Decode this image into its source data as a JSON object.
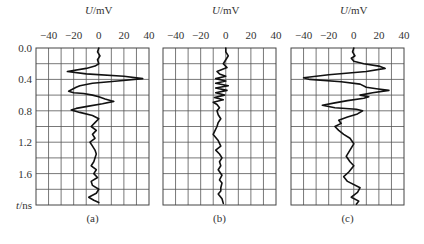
{
  "chart_data": [
    {
      "type": "line",
      "panel": "(a)",
      "title": "U/mV",
      "xlabel": "U/mV",
      "ylabel": "t/ns",
      "xlim": [
        -50,
        40
      ],
      "ylim": [
        0.0,
        2.0
      ],
      "x_ticks": [
        "-40",
        "-20",
        "0",
        "20",
        "40"
      ],
      "y_ticks": [
        "0.0",
        "0.4",
        "0.8",
        "1.2",
        "1.6"
      ],
      "grid": true,
      "series": [
        {
          "name": "trace-a",
          "points": [
            [
              0,
              0.0
            ],
            [
              -1,
              0.05
            ],
            [
              1,
              0.1
            ],
            [
              -1,
              0.15
            ],
            [
              0,
              0.2
            ],
            [
              -3,
              0.23
            ],
            [
              -10,
              0.26
            ],
            [
              -25,
              0.3
            ],
            [
              -10,
              0.33
            ],
            [
              20,
              0.36
            ],
            [
              35,
              0.39
            ],
            [
              15,
              0.42
            ],
            [
              -5,
              0.45
            ],
            [
              -15,
              0.48
            ],
            [
              -18,
              0.5
            ],
            [
              -24,
              0.55
            ],
            [
              -20,
              0.57
            ],
            [
              -12,
              0.58
            ],
            [
              -5,
              0.6
            ],
            [
              0,
              0.62
            ],
            [
              5,
              0.65
            ],
            [
              12,
              0.68
            ],
            [
              3,
              0.71
            ],
            [
              -8,
              0.74
            ],
            [
              -18,
              0.77
            ],
            [
              -22,
              0.79
            ],
            [
              -15,
              0.82
            ],
            [
              -5,
              0.86
            ],
            [
              0,
              0.9
            ],
            [
              -3,
              0.95
            ],
            [
              -6,
              1.0
            ],
            [
              -2,
              1.05
            ],
            [
              -5,
              1.1
            ],
            [
              -3,
              1.15
            ],
            [
              -7,
              1.2
            ],
            [
              -5,
              1.25
            ],
            [
              -3,
              1.3
            ],
            [
              -2,
              1.35
            ],
            [
              -3,
              1.4
            ],
            [
              -4,
              1.45
            ],
            [
              -6,
              1.5
            ],
            [
              -2,
              1.55
            ],
            [
              -4,
              1.6
            ],
            [
              -1,
              1.65
            ],
            [
              -6,
              1.7
            ],
            [
              -5,
              1.75
            ],
            [
              0,
              1.8
            ],
            [
              -2,
              1.85
            ],
            [
              -8,
              1.9
            ],
            [
              -4,
              1.94
            ],
            [
              0,
              1.97
            ]
          ]
        }
      ]
    },
    {
      "type": "line",
      "panel": "(b)",
      "title": "U/mV",
      "xlabel": "U/mV",
      "xlim": [
        -50,
        40
      ],
      "ylim": [
        0.0,
        2.0
      ],
      "x_ticks": [
        "-40",
        "-20",
        "0",
        "20",
        "40"
      ],
      "grid": true,
      "series": [
        {
          "name": "trace-b",
          "points": [
            [
              0,
              0.0
            ],
            [
              0,
              0.05
            ],
            [
              2,
              0.1
            ],
            [
              0,
              0.15
            ],
            [
              -2,
              0.2
            ],
            [
              1,
              0.25
            ],
            [
              -7,
              0.3
            ],
            [
              -5,
              0.33
            ],
            [
              0,
              0.36
            ],
            [
              -8,
              0.39
            ],
            [
              0,
              0.42
            ],
            [
              -8,
              0.45
            ],
            [
              2,
              0.48
            ],
            [
              -8,
              0.51
            ],
            [
              1,
              0.54
            ],
            [
              -8,
              0.57
            ],
            [
              -1,
              0.6
            ],
            [
              -9,
              0.63
            ],
            [
              -2,
              0.66
            ],
            [
              -10,
              0.69
            ],
            [
              -7,
              0.72
            ],
            [
              -5,
              0.76
            ],
            [
              -7,
              0.8
            ],
            [
              -6,
              0.85
            ],
            [
              -4,
              0.9
            ],
            [
              -6,
              0.95
            ],
            [
              -7,
              1.0
            ],
            [
              -10,
              1.1
            ],
            [
              -6,
              1.18
            ],
            [
              -4,
              1.25
            ],
            [
              -8,
              1.3
            ],
            [
              -5,
              1.35
            ],
            [
              -3,
              1.4
            ],
            [
              -5,
              1.45
            ],
            [
              -4,
              1.5
            ],
            [
              -6,
              1.55
            ],
            [
              -3,
              1.62
            ],
            [
              -5,
              1.68
            ],
            [
              -3,
              1.72
            ],
            [
              -4,
              1.78
            ],
            [
              -4,
              1.82
            ],
            [
              -6,
              1.86
            ],
            [
              -3,
              1.92
            ],
            [
              -2,
              1.98
            ]
          ]
        }
      ]
    },
    {
      "type": "line",
      "panel": "(c)",
      "title": "U/mV",
      "xlabel": "U/mV",
      "xlim": [
        -50,
        40
      ],
      "ylim": [
        0.0,
        2.0
      ],
      "x_ticks": [
        "-40",
        "-20",
        "0",
        "20",
        "40"
      ],
      "grid": true,
      "series": [
        {
          "name": "trace-c",
          "points": [
            [
              0,
              0.0
            ],
            [
              -1,
              0.05
            ],
            [
              1,
              0.1
            ],
            [
              -2,
              0.13
            ],
            [
              0,
              0.17
            ],
            [
              8,
              0.2
            ],
            [
              20,
              0.23
            ],
            [
              25,
              0.26
            ],
            [
              10,
              0.3
            ],
            [
              -20,
              0.34
            ],
            [
              -40,
              0.38
            ],
            [
              -35,
              0.4
            ],
            [
              -10,
              0.43
            ],
            [
              5,
              0.46
            ],
            [
              10,
              0.5
            ],
            [
              18,
              0.52
            ],
            [
              28,
              0.54
            ],
            [
              15,
              0.57
            ],
            [
              5,
              0.6
            ],
            [
              12,
              0.62
            ],
            [
              8,
              0.64
            ],
            [
              -5,
              0.67
            ],
            [
              -15,
              0.7
            ],
            [
              -25,
              0.73
            ],
            [
              -15,
              0.76
            ],
            [
              2,
              0.78
            ],
            [
              7,
              0.8
            ],
            [
              3,
              0.84
            ],
            [
              -5,
              0.88
            ],
            [
              -12,
              0.92
            ],
            [
              -10,
              0.96
            ],
            [
              -15,
              1.0
            ],
            [
              -12,
              1.05
            ],
            [
              -8,
              1.1
            ],
            [
              -3,
              1.15
            ],
            [
              0,
              1.22
            ],
            [
              -3,
              1.3
            ],
            [
              -6,
              1.38
            ],
            [
              -3,
              1.45
            ],
            [
              0,
              1.5
            ],
            [
              -4,
              1.58
            ],
            [
              -8,
              1.64
            ],
            [
              -5,
              1.7
            ],
            [
              5,
              1.78
            ],
            [
              3,
              1.84
            ],
            [
              -2,
              1.9
            ],
            [
              4,
              1.95
            ],
            [
              2,
              1.99
            ]
          ]
        }
      ]
    }
  ],
  "labels": {
    "unit_label": "U/mV",
    "y_axis_label": "t/ns",
    "captions": [
      "(a)",
      "(b)",
      "(c)"
    ],
    "x_ticks": [
      "−40",
      "−20",
      "0",
      "20",
      "40"
    ],
    "y_ticks": [
      "0.0",
      "0.4",
      "0.8",
      "1.2",
      "1.6"
    ]
  }
}
